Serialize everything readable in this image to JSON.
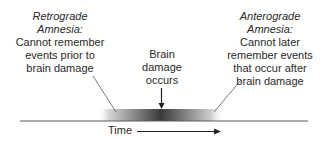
{
  "retrograde": {
    "title_line1": "Retrograde",
    "title_line2": "Amnesia:",
    "desc_lines": [
      "Cannot remember",
      "events prior to",
      "brain damage"
    ]
  },
  "anterograde": {
    "title_line1": "Anterograde",
    "title_line2": "Amnesia:",
    "desc_lines": [
      "Cannot later",
      "remember events",
      "that occur after",
      "brain damage"
    ]
  },
  "event": {
    "lines": [
      "Brain",
      "damage",
      "occurs"
    ]
  },
  "axis": {
    "label": "Time"
  },
  "colors": {
    "text": "#2a2a2a",
    "line": "#555555",
    "gradient_dark": "#2e2e2e",
    "gradient_light": "#ffffff"
  }
}
